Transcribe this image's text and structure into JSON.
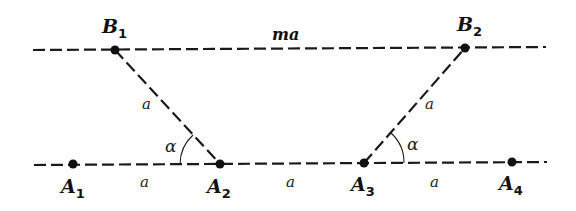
{
  "diagram": {
    "lines": {
      "top": {
        "x1": 33,
        "y1": 50,
        "x2": 546,
        "y2": 47
      },
      "bottom": {
        "x1": 34,
        "y1": 165,
        "x2": 547,
        "y2": 162
      },
      "diag_left": {
        "x1": 115,
        "y1": 50,
        "x2": 220,
        "y2": 164
      },
      "diag_right": {
        "x1": 364,
        "y1": 163,
        "x2": 465,
        "y2": 48
      }
    },
    "points": {
      "B1": {
        "letter": "B",
        "sub": "1",
        "x": 115,
        "y": 50
      },
      "B2": {
        "letter": "B",
        "sub": "2",
        "x": 465,
        "y": 48
      },
      "A1": {
        "letter": "A",
        "sub": "1",
        "x": 73,
        "y": 164
      },
      "A2": {
        "letter": "A",
        "sub": "2",
        "x": 220,
        "y": 164
      },
      "A3": {
        "letter": "A",
        "sub": "3",
        "x": 364,
        "y": 163
      },
      "A4": {
        "letter": "A",
        "sub": "4",
        "x": 512,
        "y": 162
      }
    },
    "labels": {
      "top_segment": "ma",
      "seg_A1A2": "a",
      "seg_A2A3": "a",
      "seg_A3A4": "a",
      "seg_B1A2": "a",
      "seg_A3B2": "a",
      "angle_left": "α",
      "angle_right": "α"
    },
    "colors": {
      "stroke": "#1a1a1a",
      "background": "#ffffff"
    }
  }
}
